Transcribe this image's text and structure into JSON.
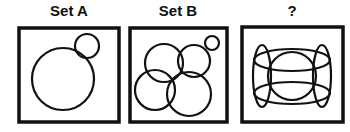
{
  "panels": [
    {
      "label": "Set A",
      "description": "One large circle with a small circle touching its upper right, inside a square"
    },
    {
      "label": "Set B",
      "description": "Four medium overlapping circles plus a small circle touching at upper right, inside a square"
    },
    {
      "label": "?",
      "description": "Overlapping ellipses: two horizontal, two vertical, and one central circle forming a grid-like figure, inside a square"
    }
  ],
  "colors": {
    "stroke": "#111111",
    "background": "#ffffff"
  }
}
